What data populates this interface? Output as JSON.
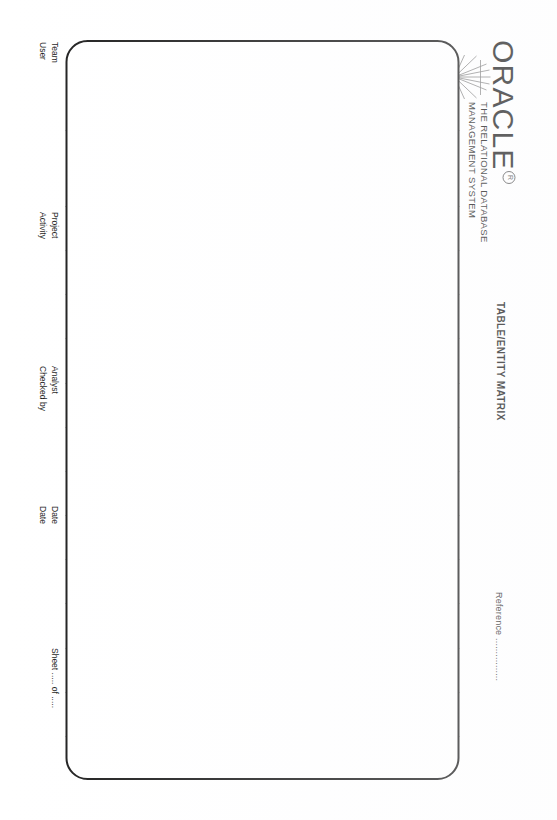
{
  "document": {
    "kind": "printed-form",
    "orientation_note": "landscape-form-rotated-90deg"
  },
  "header": {
    "brand": "ORACLE",
    "registered_mark": "R",
    "tagline_line1": "THE RELATIONAL DATABASE",
    "tagline_line2": "MANAGEMENT SYSTEM",
    "title": "TABLE/ENTITY MATRIX",
    "reference_label": "Reference ................"
  },
  "matrix": {
    "col_header_table": "TABLE",
    "col_header_short_name": "SHORT NAME",
    "col_header_ref": "REF.",
    "row_header_entity": "ENTITY",
    "entity_columns": 13,
    "table_rows": 17,
    "cells": []
  },
  "footer": {
    "team_label": "Team",
    "user_label": "User",
    "project_label": "Project",
    "activity_label": "Activity",
    "analyst_label": "Analyst",
    "checked_by_label": "Checked by",
    "date_label_1": "Date",
    "date_label_2": "Date",
    "sheet_label": "Sheet ..... of ....."
  },
  "colors": {
    "ink": "#1a1a1a",
    "rule": "#7d7d7d",
    "rule_strong": "#2a2a2a",
    "paper": "#ffffff"
  }
}
